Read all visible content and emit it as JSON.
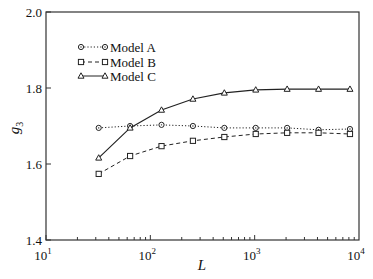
{
  "chart_data": {
    "type": "line",
    "title": "",
    "xlabel": "L",
    "ylabel": "g3",
    "xscale": "log",
    "xlim": [
      10,
      10000
    ],
    "ylim": [
      1.4,
      2.0
    ],
    "xticks": [
      {
        "base": "10",
        "exp": "1"
      },
      {
        "base": "10",
        "exp": "2"
      },
      {
        "base": "10",
        "exp": "3"
      },
      {
        "base": "10",
        "exp": "4"
      }
    ],
    "yticks": [
      "1.4",
      "1.6",
      "1.8",
      "2.0"
    ],
    "grid": false,
    "legend_position": "upper left",
    "x": [
      32,
      64,
      128,
      256,
      512,
      1024,
      2048,
      4096,
      8192
    ],
    "series": [
      {
        "name": "Model A",
        "marker": "circle",
        "line": "dotted",
        "values": [
          1.695,
          1.7,
          1.703,
          1.7,
          1.695,
          1.695,
          1.695,
          1.69,
          1.692
        ]
      },
      {
        "name": "Model B",
        "marker": "square",
        "line": "dashed",
        "values": [
          1.574,
          1.621,
          1.647,
          1.661,
          1.671,
          1.679,
          1.682,
          1.682,
          1.679
        ]
      },
      {
        "name": "Model C",
        "marker": "triangle",
        "line": "solid",
        "values": [
          1.616,
          1.695,
          1.742,
          1.771,
          1.787,
          1.795,
          1.797,
          1.797,
          1.797
        ]
      }
    ]
  },
  "labels": {
    "xlabel": "L",
    "ylabel_base": "g",
    "ylabel_sub": "3",
    "legend": [
      "Model A",
      "Model B",
      "Model C"
    ]
  },
  "colors": {
    "line": "#222222",
    "axis": "#333333"
  }
}
